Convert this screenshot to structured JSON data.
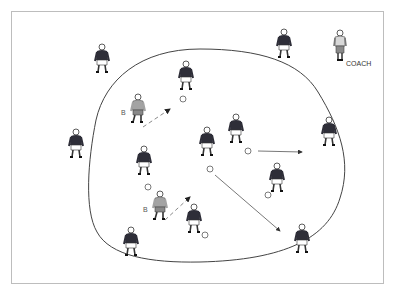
{
  "diagram": {
    "type": "soccer-drill",
    "labels": {
      "coach": "COACH",
      "player_b_top": "B",
      "player_b_bottom": "B"
    },
    "colors": {
      "frame": "#bdbdbd",
      "circle": "#444444",
      "shirt_dark": "#2e2e38",
      "shirt_light": "#9a9a9a",
      "shorts": "#ffffff",
      "arrow": "#555555",
      "pass_dashed": "#8a8a8a"
    },
    "players": [
      {
        "id": "outer-top-left",
        "x": 102,
        "y": 58,
        "kit": "dark"
      },
      {
        "id": "outer-top-right",
        "x": 284,
        "y": 43,
        "kit": "dark"
      },
      {
        "id": "coach",
        "x": 340,
        "y": 44,
        "kit": "coach"
      },
      {
        "id": "outer-left",
        "x": 76,
        "y": 143,
        "kit": "dark"
      },
      {
        "id": "outer-right",
        "x": 329,
        "y": 131,
        "kit": "dark"
      },
      {
        "id": "outer-bottom-left",
        "x": 131,
        "y": 241,
        "kit": "dark"
      },
      {
        "id": "outer-bottom-right",
        "x": 302,
        "y": 238,
        "kit": "dark"
      },
      {
        "id": "inner-top",
        "x": 186,
        "y": 75,
        "kit": "dark"
      },
      {
        "id": "player-b-top",
        "x": 138,
        "y": 108,
        "kit": "light"
      },
      {
        "id": "inner-mid-left",
        "x": 144,
        "y": 160,
        "kit": "dark"
      },
      {
        "id": "inner-center",
        "x": 207,
        "y": 141,
        "kit": "dark"
      },
      {
        "id": "inner-mid-right",
        "x": 236,
        "y": 128,
        "kit": "dark"
      },
      {
        "id": "inner-right-low",
        "x": 277,
        "y": 177,
        "kit": "dark"
      },
      {
        "id": "player-b-bottom",
        "x": 160,
        "y": 205,
        "kit": "light"
      },
      {
        "id": "inner-bottom",
        "x": 194,
        "y": 218,
        "kit": "dark"
      }
    ],
    "balls": [
      {
        "x": 183,
        "y": 99
      },
      {
        "x": 148,
        "y": 187
      },
      {
        "x": 210,
        "y": 169
      },
      {
        "x": 248,
        "y": 151
      },
      {
        "x": 268,
        "y": 195
      },
      {
        "x": 205,
        "y": 235
      }
    ],
    "arrows": [
      {
        "from": [
          258,
          151
        ],
        "to": [
          302,
          152
        ],
        "style": "solid"
      },
      {
        "from": [
          215,
          175
        ],
        "to": [
          280,
          231
        ],
        "style": "solid"
      },
      {
        "from": [
          143,
          127
        ],
        "to": [
          170,
          109
        ],
        "style": "dashed"
      },
      {
        "from": [
          165,
          220
        ],
        "to": [
          190,
          197
        ],
        "style": "dashed"
      }
    ]
  }
}
